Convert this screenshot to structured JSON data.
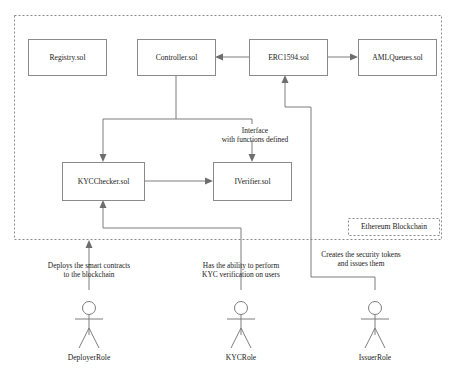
{
  "diagram": {
    "container": {
      "label": "Ethereum Blockchain"
    },
    "nodes": [
      {
        "id": "registry",
        "label": "Registry.sol",
        "x": 28,
        "y": 39,
        "w": 78,
        "h": 36
      },
      {
        "id": "controller",
        "label": "Controller.sol",
        "x": 137,
        "y": 39,
        "w": 78,
        "h": 36
      },
      {
        "id": "erc1594",
        "label": "ERC1594.sol",
        "x": 249,
        "y": 39,
        "w": 78,
        "h": 36
      },
      {
        "id": "amlqueues",
        "label": "AMLQueues.sol",
        "x": 358,
        "y": 39,
        "w": 78,
        "h": 36
      },
      {
        "id": "kycchecker",
        "label": "KYCChecker.sol",
        "x": 62,
        "y": 162,
        "w": 82,
        "h": 38
      },
      {
        "id": "iverifier",
        "label": "IVerifier.sol",
        "x": 213,
        "y": 162,
        "w": 78,
        "h": 38
      }
    ],
    "edge_labels": [
      {
        "id": "interface-label",
        "line1": "Interface",
        "line2": "with functions defined",
        "x": 255,
        "y": 131
      },
      {
        "id": "deployer-label",
        "line1": "Deploys the smart contracts",
        "line2": "to the blockchain",
        "x": 89,
        "y": 266
      },
      {
        "id": "kyc-label",
        "line1": "Has the ability to perform",
        "line2": "KYC verification on users",
        "x": 241,
        "y": 266
      },
      {
        "id": "issuer-label",
        "line1": "Creates the security tokens",
        "line2": "and issues them",
        "x": 361,
        "y": 259
      }
    ],
    "actors": [
      {
        "id": "deployer",
        "label": "DeployerRole",
        "x": 89,
        "y": 300
      },
      {
        "id": "kyc",
        "label": "KYCRole",
        "x": 241,
        "y": 300
      },
      {
        "id": "issuer",
        "label": "IssuerRole",
        "x": 375,
        "y": 300
      }
    ],
    "colors": {
      "box_stroke": "#8a8a8a",
      "connector": "#7d7d7d",
      "text": "#1a1a1a",
      "background": "#ffffff"
    }
  }
}
